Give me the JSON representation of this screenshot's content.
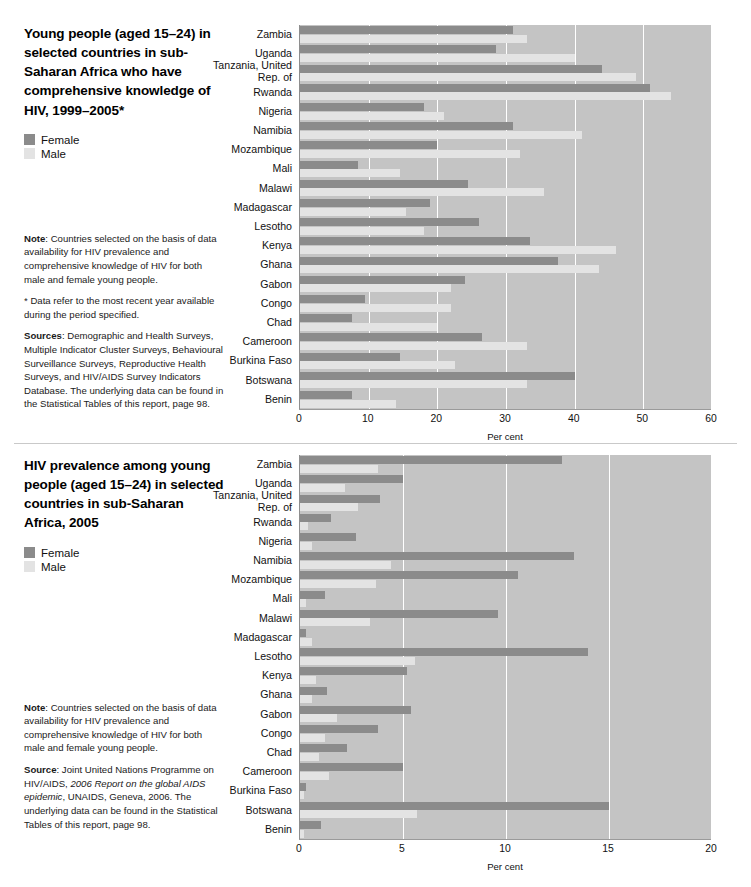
{
  "panels": [
    {
      "id": "comprehensive-knowledge",
      "title": "Young people (aged 15–24) in selected countries in sub-Saharan Africa who have comprehensive knowledge of HIV, 1999–2005*",
      "legend": {
        "position": "left",
        "items": [
          {
            "label": "Female",
            "color": "#8b8b8b"
          },
          {
            "label": "Male",
            "color": "#e3e3e3"
          }
        ]
      },
      "notes": [
        {
          "lead": "Note",
          "text": ": Countries selected on the basis of data availability for HIV prevalence and comprehensive knowledge of HIV for both male and female young people."
        },
        {
          "lead": "",
          "text": "* Data refer to the most recent year available during the period specified."
        },
        {
          "lead": "Sources",
          "text": ": Demographic and Health Surveys, Multiple Indicator Cluster Surveys, Behavioural Surveillance Surveys, Reproductive Health Surveys, and HIV/AIDS Survey Indicators Database. The underlying data can be found in the Statistical Tables of this report, page 98."
        }
      ],
      "chart_data": {
        "type": "bar",
        "orientation": "horizontal",
        "title": "Young people (aged 15–24) in selected countries in sub-Saharan Africa who have comprehensive knowledge of HIV, 1999–2005*",
        "xlabel": "Per cent",
        "ylabel": "",
        "xlim": [
          0,
          60
        ],
        "xticks": [
          0,
          10,
          20,
          30,
          40,
          50,
          60
        ],
        "grid": true,
        "legend_position": "left",
        "categories": [
          "Zambia",
          "Uganda",
          "Tanzania, United Rep. of",
          "Rwanda",
          "Nigeria",
          "Namibia",
          "Mozambique",
          "Mali",
          "Malawi",
          "Madagascar",
          "Lesotho",
          "Kenya",
          "Ghana",
          "Gabon",
          "Congo",
          "Chad",
          "Cameroon",
          "Burkina Faso",
          "Botswana",
          "Benin"
        ],
        "series": [
          {
            "name": "Female",
            "color": "#8b8b8b",
            "values": [
              31,
              28.5,
              44,
              51,
              18,
              31,
              20,
              8.5,
              24.5,
              19,
              26,
              33.5,
              37.5,
              24,
              9.5,
              7.5,
              26.5,
              14.5,
              40,
              7.5
            ]
          },
          {
            "name": "Male",
            "color": "#e3e3e3",
            "values": [
              33,
              40,
              49,
              54,
              21,
              41,
              32,
              14.5,
              35.5,
              15.5,
              18,
              46,
              43.5,
              22,
              22,
              20,
              33,
              22.5,
              33,
              14
            ]
          }
        ]
      }
    },
    {
      "id": "hiv-prevalence",
      "title": "HIV prevalence among young people (aged 15–24) in selected countries in sub-Saharan Africa, 2005",
      "legend": {
        "position": "left",
        "items": [
          {
            "label": "Female",
            "color": "#8b8b8b"
          },
          {
            "label": "Male",
            "color": "#e3e3e3"
          }
        ]
      },
      "notes": [
        {
          "lead": "Note",
          "text": ": Countries selected on the basis of data availability for HIV prevalence and comprehensive knowledge of HIV for both male and female young people."
        },
        {
          "lead": "Source",
          "text": ": Joint United Nations Programme on HIV/AIDS, ",
          "italic": "2006 Report on the global AIDS epidemic",
          "text2": ", UNAIDS, Geneva, 2006. The underlying data can be found in the Statistical Tables of this report, page 98."
        }
      ],
      "chart_data": {
        "type": "bar",
        "orientation": "horizontal",
        "title": "HIV prevalence among young people (aged 15–24) in selected countries in sub-Saharan Africa, 2005",
        "xlabel": "Per cent",
        "ylabel": "",
        "xlim": [
          0,
          20
        ],
        "xticks": [
          0,
          5,
          10,
          15,
          20
        ],
        "grid": true,
        "legend_position": "left",
        "categories": [
          "Zambia",
          "Uganda",
          "Tanzania, United Rep. of",
          "Rwanda",
          "Nigeria",
          "Namibia",
          "Mozambique",
          "Mali",
          "Malawi",
          "Madagascar",
          "Lesotho",
          "Kenya",
          "Ghana",
          "Gabon",
          "Congo",
          "Chad",
          "Cameroon",
          "Burkina Faso",
          "Botswana",
          "Benin"
        ],
        "series": [
          {
            "name": "Female",
            "color": "#8b8b8b",
            "values": [
              12.7,
              5.0,
              3.9,
              1.5,
              2.7,
              13.3,
              10.6,
              1.2,
              9.6,
              0.3,
              14.0,
              5.2,
              1.3,
              5.4,
              3.8,
              2.3,
              5.0,
              0.3,
              15.0,
              1.0
            ]
          },
          {
            "name": "Male",
            "color": "#e3e3e3",
            "values": [
              3.8,
              2.2,
              2.8,
              0.4,
              0.6,
              4.4,
              3.7,
              0.3,
              3.4,
              0.6,
              5.6,
              0.8,
              0.6,
              1.8,
              1.2,
              0.9,
              1.4,
              0.2,
              5.7,
              0.2
            ]
          }
        ]
      }
    }
  ]
}
